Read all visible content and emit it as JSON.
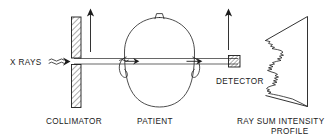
{
  "figure": {
    "background_color": "#ffffff",
    "line_color": "#202020",
    "text_color": "#1a1a1a",
    "width": 333,
    "height": 139
  },
  "labels": {
    "source": "X RAYS",
    "collimator": "COLLIMATOR",
    "patient": "PATIENT",
    "detector": "DETECTOR",
    "profile_line1": "RAY SUM INTENSITY",
    "profile_line2": "PROFILE"
  },
  "components": [
    {
      "name": "x-ray-source",
      "label": "X RAYS",
      "icon": "wavy-arrow-icon",
      "description": "Wavy arrow indicating incident x-ray beam travelling to the right"
    },
    {
      "name": "collimator",
      "label": "COLLIMATOR",
      "icon": "hatched-bar-icon",
      "description": "Vertical cross-hatched block with a narrow slit aperture; translates vertically"
    },
    {
      "name": "patient",
      "label": "PATIENT",
      "icon": "head-outline-icon",
      "description": "Axial outline of a head with nose at top and an ear on each side"
    },
    {
      "name": "detector",
      "label": "DETECTOR",
      "icon": "hatched-square-icon",
      "description": "Small cross-hatched square at the exit end of the pencil beam; translates vertically"
    },
    {
      "name": "ray-sum-intensity-profile",
      "label": "RAY SUM INTENSITY PROFILE",
      "icon": "profile-trace-icon",
      "description": "Jagged intensity trace plotted against a vertical baseline forming a wedge"
    }
  ],
  "annotations": {
    "translation_arrows": {
      "name": "translation-arrow",
      "count": 2,
      "direction": "up",
      "meaning": "Linear translation of collimator and detector across the patient"
    },
    "beam_arrows": {
      "name": "beam-direction-arrow",
      "count": 2,
      "direction": "right",
      "meaning": "Direction of pencil beam propagation through the patient"
    },
    "beam": {
      "name": "pencil-beam",
      "style": "narrow parallel channel"
    }
  }
}
